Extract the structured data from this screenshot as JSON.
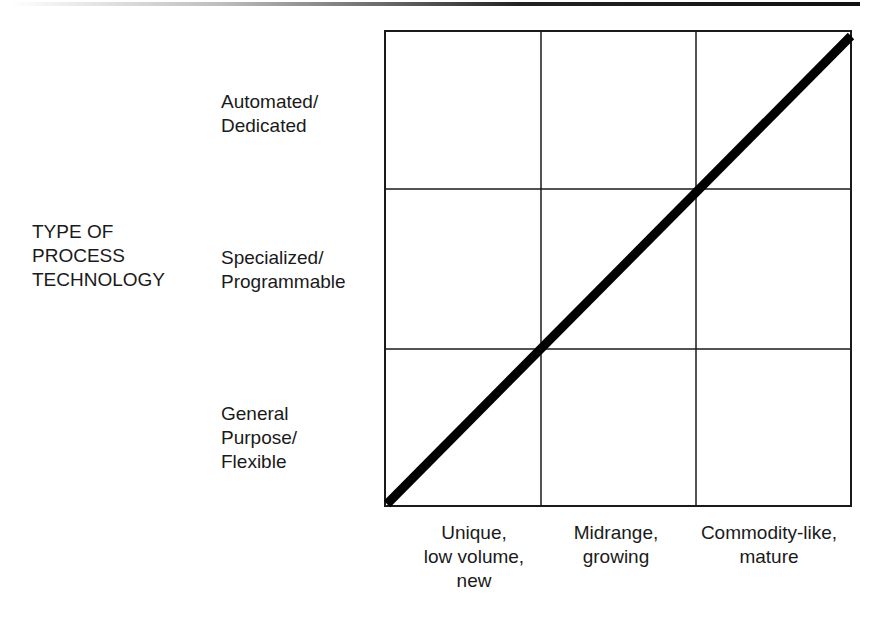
{
  "diagram": {
    "y_axis_title": "TYPE OF\nPROCESS\nTECHNOLOGY",
    "rows": [
      {
        "label": "Automated/\nDedicated"
      },
      {
        "label": "Specialized/\nProgrammable"
      },
      {
        "label": "General\nPurpose/\nFlexible"
      }
    ],
    "columns": [
      {
        "label": "Unique,\nlow volume,\nnew"
      },
      {
        "label": "Midrange,\ngrowing"
      },
      {
        "label": "Commodity-like,\nmature"
      }
    ],
    "grid": {
      "rows": 3,
      "cols": 3
    },
    "diagonal": {
      "from": "bottom-left",
      "to": "top-right",
      "color": "#000000"
    },
    "colors": {
      "line": "#1a1a1a",
      "background": "#ffffff"
    }
  }
}
